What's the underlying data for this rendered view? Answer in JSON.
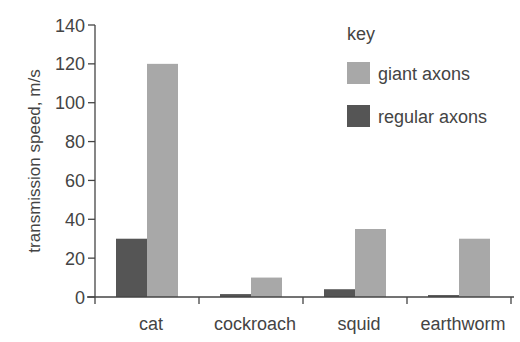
{
  "chart_data": {
    "type": "bar",
    "title": "",
    "xlabel": "",
    "ylabel": "transmission speed, m/s",
    "ylim": [
      0,
      140
    ],
    "yticks": [
      0,
      20,
      40,
      60,
      80,
      100,
      120,
      140
    ],
    "grid": false,
    "legend_title": "key",
    "legend_position": "top-right",
    "categories": [
      "cat",
      "cockroach",
      "squid",
      "earthworm"
    ],
    "series": [
      {
        "name": "regular axons",
        "color": "#555555",
        "values": [
          30,
          1.5,
          4,
          1
        ]
      },
      {
        "name": "giant axons",
        "color": "#a8a8a8",
        "values": [
          120,
          10,
          35,
          30
        ]
      }
    ]
  }
}
